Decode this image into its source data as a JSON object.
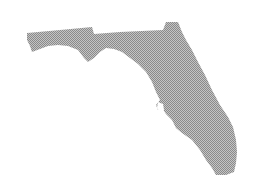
{
  "figure": {
    "subject": "Florida state silhouette",
    "style": "halftone dot pattern",
    "fill_color": "#9a9a9a",
    "dot_color": "#8c8c8c",
    "background": "#ffffff"
  }
}
